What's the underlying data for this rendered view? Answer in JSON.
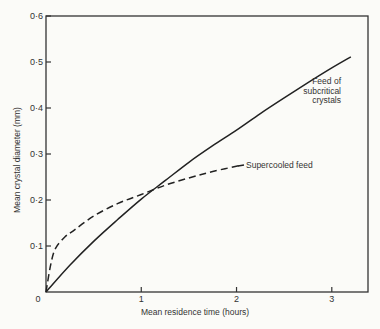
{
  "chart_data": {
    "type": "line",
    "title": "",
    "xlabel": "Mean residence time (hours)",
    "ylabel": "Mean crystal diameter (mm)",
    "xlim": [
      0,
      3.38
    ],
    "ylim": [
      0,
      0.6
    ],
    "grid": false,
    "legend": "none (direct curve annotations)",
    "x_ticks": [
      {
        "value": 0,
        "label": "0"
      },
      {
        "value": 1,
        "label": "1"
      },
      {
        "value": 2,
        "label": "2"
      },
      {
        "value": 3,
        "label": "3"
      }
    ],
    "y_ticks": [
      {
        "value": 0.1,
        "label": "0·1"
      },
      {
        "value": 0.2,
        "label": "0·2"
      },
      {
        "value": 0.3,
        "label": "0·3"
      },
      {
        "value": 0.4,
        "label": "0·4"
      },
      {
        "value": 0.5,
        "label": "0·5"
      },
      {
        "value": 0.6,
        "label": "0·6"
      }
    ],
    "series": [
      {
        "name": "Feed of subcritical crystals",
        "style": "solid",
        "x": [
          0,
          0.25,
          0.5,
          0.75,
          1.0,
          1.25,
          1.5,
          1.75,
          2.0,
          2.25,
          2.5,
          2.75,
          3.0,
          3.2
        ],
        "y": [
          0,
          0.058,
          0.11,
          0.157,
          0.202,
          0.242,
          0.282,
          0.318,
          0.352,
          0.388,
          0.422,
          0.455,
          0.487,
          0.511
        ]
      },
      {
        "name": "Supercooled feed",
        "style": "dashed",
        "x": [
          0,
          0.05,
          0.1,
          0.2,
          0.3,
          0.5,
          0.75,
          1.0,
          1.25,
          1.5,
          1.75,
          2.06
        ],
        "y": [
          0,
          0.06,
          0.095,
          0.12,
          0.135,
          0.165,
          0.192,
          0.212,
          0.232,
          0.248,
          0.262,
          0.276
        ]
      }
    ],
    "annotations": [
      {
        "text_lines": [
          "Feed of",
          "subcritical",
          "crystals"
        ],
        "x": 3.05,
        "y": 0.43
      },
      {
        "text": "Supercooled feed",
        "x": 2.1,
        "y": 0.276
      }
    ],
    "origin_label": "0"
  }
}
